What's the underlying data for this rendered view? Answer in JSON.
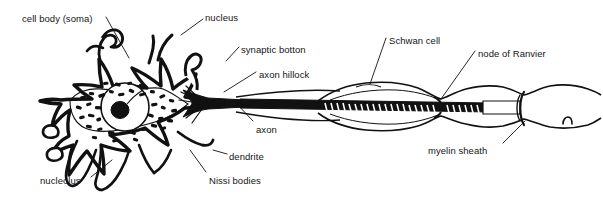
{
  "diagram": {
    "type": "anatomical-line-drawing",
    "ink_color": "#111111",
    "background_color": "#ffffff",
    "text_color": "#151515",
    "width": 603,
    "height": 197
  },
  "labels": [
    {
      "id": "cell-body-soma",
      "text": "cell body (soma)",
      "x": 22,
      "y": 13,
      "anchor": "left"
    },
    {
      "id": "nucleus",
      "text": "nucleus",
      "x": 205,
      "y": 12,
      "anchor": "left"
    },
    {
      "id": "synaptic-botton",
      "text": "synaptic botton",
      "x": 241,
      "y": 44,
      "anchor": "left"
    },
    {
      "id": "axon-hillock",
      "text": "axon hillock",
      "x": 259,
      "y": 69,
      "anchor": "left"
    },
    {
      "id": "axon",
      "text": "axon",
      "x": 256,
      "y": 124,
      "anchor": "left"
    },
    {
      "id": "dendrite",
      "text": "dendrite",
      "x": 229,
      "y": 151,
      "anchor": "left"
    },
    {
      "id": "nissi-bodies",
      "text": "Nissi bodies",
      "x": 209,
      "y": 175,
      "anchor": "left"
    },
    {
      "id": "nucleolus",
      "text": "nucleolus",
      "x": 40,
      "y": 175,
      "anchor": "left"
    },
    {
      "id": "schwan-cell",
      "text": "Schwan cell",
      "x": 389,
      "y": 35,
      "anchor": "left"
    },
    {
      "id": "node-of-ranvier",
      "text": "node of Ranvier",
      "x": 478,
      "y": 48,
      "anchor": "left"
    },
    {
      "id": "myelin-sheath",
      "text": "myelin sheath",
      "x": 428,
      "y": 145,
      "anchor": "left"
    }
  ],
  "leader_lines": [
    {
      "id": "leader-cell-body-soma",
      "from": [
        106,
        17
      ],
      "to": [
        129,
        58
      ]
    },
    {
      "id": "leader-nucleus",
      "from": [
        203,
        19
      ],
      "to": [
        181,
        35
      ]
    },
    {
      "id": "leader-synaptic-botton",
      "from": [
        239,
        47
      ],
      "to": [
        228,
        61
      ]
    },
    {
      "id": "leader-axon-hillock",
      "from": [
        256,
        72
      ],
      "to": [
        232,
        89
      ]
    },
    {
      "id": "leader-axon",
      "from": [
        253,
        121
      ],
      "to": [
        240,
        104
      ]
    },
    {
      "id": "leader-dendrite",
      "from": [
        227,
        154
      ],
      "to": [
        214,
        150
      ]
    },
    {
      "id": "leader-nissi-bodies",
      "from": [
        206,
        172
      ],
      "to": [
        194,
        155
      ]
    },
    {
      "id": "leader-nucleolus",
      "from": [
        91,
        177
      ],
      "to": [
        110,
        161
      ]
    },
    {
      "id": "leader-schwan-cell",
      "from": [
        386,
        38
      ],
      "to": [
        370,
        84
      ]
    },
    {
      "id": "leader-node-of-ranvier",
      "from": [
        475,
        51
      ],
      "to": [
        441,
        98
      ]
    },
    {
      "id": "leader-myelin-sheath",
      "from": [
        503,
        143
      ],
      "to": [
        525,
        122
      ]
    }
  ],
  "structures": [
    {
      "id": "soma",
      "name": "cell body (soma)"
    },
    {
      "id": "dendrites",
      "name": "dendrite"
    },
    {
      "id": "nucleus",
      "name": "nucleus"
    },
    {
      "id": "nucleolus",
      "name": "nucleolus"
    },
    {
      "id": "nissl-bodies",
      "name": "Nissi bodies"
    },
    {
      "id": "axon-hillock",
      "name": "axon hillock"
    },
    {
      "id": "axon",
      "name": "axon"
    },
    {
      "id": "myelin-sheath",
      "name": "myelin sheath"
    },
    {
      "id": "schwann-cell",
      "name": "Schwan cell"
    },
    {
      "id": "node-of-ranvier",
      "name": "node of Ranvier"
    },
    {
      "id": "synaptic-botton",
      "name": "synaptic botton"
    }
  ]
}
